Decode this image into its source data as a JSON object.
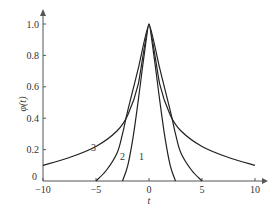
{
  "chart_data": {
    "type": "line",
    "title": "",
    "xlabel": "t",
    "ylabel": "φ(t)",
    "xlim": [
      -10,
      10
    ],
    "ylim": [
      0,
      1.0
    ],
    "grid": false,
    "legend": "inline curve labels",
    "x_ticks": [
      "−10",
      "−5",
      "0",
      "5",
      "10"
    ],
    "y_ticks": [
      "0",
      "0.2",
      "0.4",
      "0.6",
      "0.8",
      "1.0"
    ],
    "series": [
      {
        "name": "1",
        "x": [
          -2.5,
          -2.0,
          -1.5,
          -1.0,
          -0.5,
          0,
          0.5,
          1.0,
          1.5,
          2.0,
          2.5
        ],
        "values": [
          0,
          0.1,
          0.28,
          0.52,
          0.78,
          1.0,
          0.78,
          0.52,
          0.28,
          0.1,
          0
        ]
      },
      {
        "name": "2",
        "x": [
          -5,
          -4,
          -3,
          -2.5,
          -2,
          -1,
          0,
          1,
          2,
          2.5,
          3,
          4,
          5
        ],
        "values": [
          0,
          0.07,
          0.18,
          0.3,
          0.45,
          0.72,
          1.0,
          0.72,
          0.45,
          0.3,
          0.18,
          0.07,
          0
        ]
      },
      {
        "name": "3",
        "x": [
          -10,
          -7.5,
          -5,
          -3,
          -2,
          -1,
          0,
          1,
          2,
          3,
          5,
          7.5,
          10
        ],
        "values": [
          0.1,
          0.15,
          0.22,
          0.32,
          0.42,
          0.62,
          1.0,
          0.62,
          0.42,
          0.32,
          0.22,
          0.15,
          0.1
        ]
      }
    ],
    "annotations": [
      {
        "text": "3",
        "x": -6.2,
        "y": 0.26
      },
      {
        "text": "2",
        "x": -3.4,
        "y": 0.21
      },
      {
        "text": "1",
        "x": -1.6,
        "y": 0.21
      }
    ]
  },
  "labels": {
    "y_axis": "φ(t)",
    "x_axis": "t",
    "curve1": "1",
    "curve2": "2",
    "curve3": "3"
  }
}
